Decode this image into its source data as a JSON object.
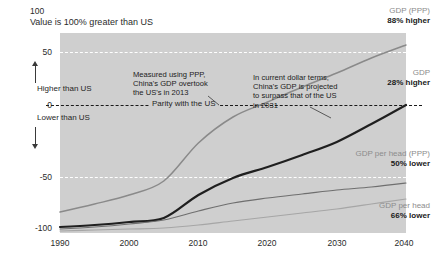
{
  "chart_data": {
    "type": "line",
    "title": "",
    "subtitle": "Value is 100% greater than US",
    "top_axis_value": "100",
    "xlabel": "",
    "ylabel": "",
    "xlim": [
      1990,
      2040
    ],
    "ylim": [
      -100,
      100
    ],
    "grid": true,
    "legend_position": "right-inline",
    "x": [
      1990,
      1995,
      2000,
      2005,
      2010,
      2015,
      2020,
      2025,
      2030,
      2035,
      2040
    ],
    "y_ticks": [
      "100",
      "50",
      "0",
      "-50",
      "-100"
    ],
    "x_ticks": [
      "1990",
      "2000",
      "2010",
      "2020",
      "2030",
      "2040"
    ],
    "series": [
      {
        "name": "GDP (PPP)",
        "end_label": "88% higher",
        "color": "#8a8a8a",
        "values": [
          -79,
          -71,
          -62,
          -48,
          -10,
          16,
          31,
          46,
          60,
          75,
          88
        ]
      },
      {
        "name": "GDP",
        "end_label": "28% higher",
        "color": "#1f1f1f",
        "values": [
          -94,
          -92,
          -89,
          -85,
          -62,
          -45,
          -34,
          -22,
          -9,
          9,
          28
        ]
      },
      {
        "name": "GDP per head (PPP)",
        "end_label": "50% lower",
        "color": "#6f6f6f",
        "values": [
          -96,
          -94,
          -91,
          -87,
          -78,
          -70,
          -65,
          -61,
          -57,
          -54,
          -50
        ]
      },
      {
        "name": "GDP per head",
        "end_label": "66% lower",
        "color": "#a6a6a6",
        "values": [
          -98,
          -97,
          -96,
          -95,
          -92,
          -88,
          -84,
          -80,
          -76,
          -71,
          -66
        ]
      }
    ],
    "gridlines": [
      {
        "value": 50,
        "style": "dashed-white"
      },
      {
        "value": -50,
        "style": "dashed-white"
      },
      {
        "value": 0,
        "style": "dashed-black",
        "label": "Parity with the US"
      }
    ],
    "axis_notes": {
      "higher": "Higher than US",
      "lower": "Lower than US",
      "parity": "Parity with the US"
    },
    "annotations": [
      {
        "id": "ppp-overtake",
        "text": "Measured using PPP,\nChina's GDP overtook\nthe US's in 2013",
        "points_to_year": 2013
      },
      {
        "id": "usd-surpass",
        "text": "In current dollar terms,\nChina's GDP is projected\nto surpass that of the US\nin 2031",
        "points_to_year": 2031
      }
    ],
    "colors": {
      "plot_background": "#cfcfcf",
      "page_background": "#ffffff",
      "gridline_white": "#ffffff",
      "gridline_zero": "#1a1a1a",
      "label_muted": "#8c8c8c",
      "label_dark": "#1a1a1a"
    }
  }
}
